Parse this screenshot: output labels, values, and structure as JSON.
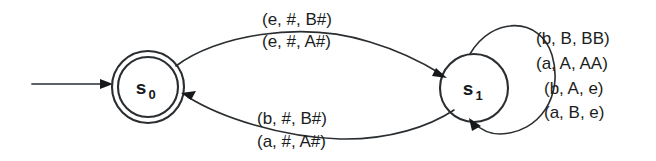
{
  "figure": {
    "kind": "pushdown-automaton-state-diagram",
    "background_color": "#ffffff",
    "ink_color": "#2a2e31"
  },
  "states": [
    {
      "id": "s0",
      "base": "s",
      "subscript": "0",
      "accepting": true,
      "shape": "double-circle",
      "cx": 148,
      "cy": 87,
      "r_outer": 36,
      "r_inner": 30
    },
    {
      "id": "s1",
      "base": "s",
      "subscript": "1",
      "accepting": false,
      "shape": "circle",
      "cx": 474,
      "cy": 88,
      "r_outer": 34,
      "r_inner": 34
    }
  ],
  "start_arrow": {
    "name": "start-arrow",
    "from_x": 32,
    "to_x": 112,
    "y": 84
  },
  "transitions": [
    {
      "id": "t-s0-s1",
      "from": "s0",
      "to": "s1",
      "direction": "left-to-right",
      "curve": "upper",
      "labels": [
        "(e, #, B#)",
        "(e, #, A#)"
      ]
    },
    {
      "id": "t-s1-s0",
      "from": "s1",
      "to": "s0",
      "direction": "right-to-left",
      "curve": "lower",
      "labels": [
        "(b, #, B#)",
        "(a, #, A#)"
      ]
    },
    {
      "id": "t-s1-s1",
      "from": "s1",
      "to": "s1",
      "direction": "self-loop",
      "curve": "right",
      "labels": [
        "(b, B, BB)",
        "(a, A, AA)",
        "(b, A, e)",
        "(a, B, e)"
      ]
    }
  ],
  "label_blocks": {
    "upper": {
      "name": "upper-edge-labels",
      "x": 262,
      "lines": [
        {
          "text": "(e, #, B#)",
          "y": 25
        },
        {
          "text": "(e, #, A#)",
          "y": 47
        }
      ]
    },
    "lower": {
      "name": "lower-edge-labels",
      "x": 257,
      "lines": [
        {
          "text": "(b, #, B#)",
          "y": 124
        },
        {
          "text": "(a, #, A#)",
          "y": 147
        }
      ]
    },
    "loop": {
      "name": "self-loop-labels",
      "x": 536,
      "lines": [
        {
          "text": "(b, B, BB)",
          "y": 44
        },
        {
          "text": "(a, A, AA)",
          "y": 69
        },
        {
          "text": "(b, A, e)",
          "y": 94,
          "indent": 8
        },
        {
          "text": "(a, B, e)",
          "y": 118,
          "indent": 8
        }
      ]
    }
  }
}
